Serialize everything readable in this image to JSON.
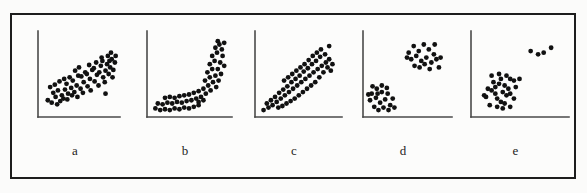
{
  "figure": {
    "caption_labels": [
      "a",
      "b",
      "c",
      "d",
      "e"
    ],
    "background_color": "#fcfcfb",
    "frame_color": "#1d1d1d",
    "dot_color": "#111111",
    "axis_color": "#4a4a4a",
    "dot_radius": 2.4,
    "panel_count": 5
  },
  "chart_data": [
    {
      "type": "scatter",
      "title": "a",
      "label": "a",
      "pattern": "positive linear association",
      "xlabel": "",
      "ylabel": "",
      "xlim": [
        0,
        100
      ],
      "ylim": [
        0,
        100
      ],
      "grid": false,
      "legend": "none",
      "axis_origin": {
        "x": 36,
        "y": 128
      },
      "axis_x_end": 118,
      "axis_y_top": 42,
      "n_points": 62,
      "points": [
        [
          10,
          18
        ],
        [
          15,
          15
        ],
        [
          20,
          22
        ],
        [
          26,
          17
        ],
        [
          17,
          27
        ],
        [
          23,
          30
        ],
        [
          13,
          34
        ],
        [
          19,
          37
        ],
        [
          28,
          24
        ],
        [
          32,
          31
        ],
        [
          25,
          41
        ],
        [
          31,
          44
        ],
        [
          36,
          26
        ],
        [
          40,
          33
        ],
        [
          34,
          38
        ],
        [
          38,
          46
        ],
        [
          44,
          28
        ],
        [
          47,
          36
        ],
        [
          42,
          42
        ],
        [
          49,
          48
        ],
        [
          45,
          54
        ],
        [
          52,
          32
        ],
        [
          56,
          40
        ],
        [
          53,
          47
        ],
        [
          58,
          52
        ],
        [
          50,
          58
        ],
        [
          61,
          35
        ],
        [
          64,
          44
        ],
        [
          60,
          50
        ],
        [
          67,
          55
        ],
        [
          63,
          61
        ],
        [
          70,
          41
        ],
        [
          73,
          49
        ],
        [
          69,
          57
        ],
        [
          76,
          52
        ],
        [
          72,
          64
        ],
        [
          78,
          60
        ],
        [
          81,
          46
        ],
        [
          84,
          54
        ],
        [
          80,
          66
        ],
        [
          86,
          62
        ],
        [
          88,
          50
        ],
        [
          90,
          58
        ],
        [
          92,
          68
        ],
        [
          87,
          72
        ],
        [
          94,
          55
        ],
        [
          96,
          64
        ],
        [
          91,
          76
        ],
        [
          30,
          20
        ],
        [
          35,
          19
        ],
        [
          48,
          22
        ],
        [
          55,
          27
        ],
        [
          41,
          24
        ],
        [
          22,
          13
        ],
        [
          65,
          30
        ],
        [
          75,
          36
        ],
        [
          83,
          40
        ],
        [
          93,
          46
        ],
        [
          97,
          72
        ],
        [
          89,
          66
        ],
        [
          79,
          70
        ],
        [
          84,
          26
        ]
      ],
      "outlier_points": [
        [
          84,
          26
        ]
      ]
    },
    {
      "type": "scatter",
      "title": "b",
      "label": "b",
      "pattern": "nonlinear J-shaped (curvilinear) association",
      "xlabel": "",
      "ylabel": "",
      "xlim": [
        0,
        100
      ],
      "ylim": [
        0,
        100
      ],
      "grid": false,
      "legend": "none",
      "axis_origin": {
        "x": 145,
        "y": 128
      },
      "axis_x_end": 232,
      "axis_y_top": 42,
      "n_points": 56,
      "points": [
        [
          8,
          8
        ],
        [
          14,
          6
        ],
        [
          20,
          7
        ],
        [
          26,
          6
        ],
        [
          32,
          8
        ],
        [
          38,
          7
        ],
        [
          44,
          9
        ],
        [
          50,
          8
        ],
        [
          56,
          10
        ],
        [
          62,
          12
        ],
        [
          11,
          14
        ],
        [
          17,
          13
        ],
        [
          23,
          15
        ],
        [
          29,
          14
        ],
        [
          35,
          16
        ],
        [
          41,
          15
        ],
        [
          47,
          17
        ],
        [
          53,
          18
        ],
        [
          59,
          20
        ],
        [
          65,
          22
        ],
        [
          20,
          21
        ],
        [
          26,
          22
        ],
        [
          32,
          21
        ],
        [
          38,
          23
        ],
        [
          44,
          24
        ],
        [
          50,
          25
        ],
        [
          56,
          27
        ],
        [
          62,
          29
        ],
        [
          68,
          32
        ],
        [
          71,
          26
        ],
        [
          74,
          36
        ],
        [
          77,
          30
        ],
        [
          70,
          42
        ],
        [
          76,
          46
        ],
        [
          80,
          40
        ],
        [
          73,
          52
        ],
        [
          79,
          56
        ],
        [
          83,
          48
        ],
        [
          76,
          62
        ],
        [
          82,
          66
        ],
        [
          86,
          56
        ],
        [
          79,
          72
        ],
        [
          85,
          76
        ],
        [
          89,
          64
        ],
        [
          83,
          82
        ],
        [
          88,
          86
        ],
        [
          92,
          72
        ],
        [
          86,
          90
        ],
        [
          91,
          80
        ],
        [
          94,
          60
        ],
        [
          90,
          50
        ],
        [
          87,
          42
        ],
        [
          84,
          34
        ],
        [
          94,
          88
        ],
        [
          68,
          18
        ],
        [
          62,
          16
        ]
      ]
    },
    {
      "type": "scatter",
      "title": "c",
      "label": "c",
      "pattern": "fan / wedge shaped spread increasing with x",
      "xlabel": "",
      "ylabel": "",
      "xlim": [
        0,
        100
      ],
      "ylim": [
        0,
        100
      ],
      "grid": false,
      "legend": "none",
      "axis_origin": {
        "x": 252,
        "y": 128
      },
      "axis_x_end": 340,
      "axis_y_top": 42,
      "n_points": 58,
      "points": [
        [
          8,
          6
        ],
        [
          14,
          9
        ],
        [
          12,
          14
        ],
        [
          19,
          12
        ],
        [
          17,
          18
        ],
        [
          24,
          16
        ],
        [
          22,
          22
        ],
        [
          29,
          20
        ],
        [
          27,
          27
        ],
        [
          34,
          24
        ],
        [
          32,
          31
        ],
        [
          39,
          28
        ],
        [
          37,
          35
        ],
        [
          44,
          32
        ],
        [
          42,
          40
        ],
        [
          49,
          36
        ],
        [
          47,
          44
        ],
        [
          54,
          40
        ],
        [
          52,
          48
        ],
        [
          59,
          44
        ],
        [
          57,
          53
        ],
        [
          64,
          48
        ],
        [
          62,
          57
        ],
        [
          69,
          52
        ],
        [
          67,
          62
        ],
        [
          74,
          56
        ],
        [
          72,
          66
        ],
        [
          79,
          60
        ],
        [
          77,
          71
        ],
        [
          84,
          64
        ],
        [
          58,
          62
        ],
        [
          53,
          58
        ],
        [
          48,
          54
        ],
        [
          43,
          50
        ],
        [
          38,
          46
        ],
        [
          33,
          42
        ],
        [
          63,
          67
        ],
        [
          68,
          72
        ],
        [
          73,
          76
        ],
        [
          78,
          80
        ],
        [
          83,
          74
        ],
        [
          88,
          68
        ],
        [
          86,
          58
        ],
        [
          81,
          52
        ],
        [
          76,
          46
        ],
        [
          71,
          40
        ],
        [
          66,
          36
        ],
        [
          61,
          32
        ],
        [
          56,
          28
        ],
        [
          51,
          24
        ],
        [
          46,
          20
        ],
        [
          41,
          17
        ],
        [
          36,
          14
        ],
        [
          31,
          11
        ],
        [
          26,
          9
        ],
        [
          88,
          84
        ],
        [
          92,
          62
        ],
        [
          90,
          54
        ]
      ]
    },
    {
      "type": "scatter",
      "title": "d",
      "label": "d",
      "pattern": "two separated clusters (lower-left and upper-right)",
      "xlabel": "",
      "ylabel": "",
      "xlim": [
        0,
        100
      ],
      "ylim": [
        0,
        100
      ],
      "grid": false,
      "legend": "none",
      "axis_origin": {
        "x": 360,
        "y": 128
      },
      "axis_x_end": 450,
      "axis_y_top": 42,
      "n_points": 40,
      "clusters": [
        {
          "name": "lower-left cluster",
          "points": [
            [
              8,
              26
            ],
            [
              14,
              32
            ],
            [
              6,
              18
            ],
            [
              13,
              21
            ],
            [
              20,
              28
            ],
            [
              18,
              15
            ],
            [
              11,
              10
            ],
            [
              24,
              19
            ],
            [
              27,
              26
            ],
            [
              22,
              9
            ],
            [
              30,
              12
            ],
            [
              16,
              6
            ],
            [
              9,
              35
            ],
            [
              20,
              36
            ],
            [
              26,
              33
            ],
            [
              33,
              20
            ],
            [
              35,
              9
            ],
            [
              28,
              6
            ],
            [
              4,
              25
            ],
            [
              15,
              26
            ]
          ]
        },
        {
          "name": "upper-right cluster",
          "points": [
            [
              52,
              76
            ],
            [
              58,
              84
            ],
            [
              64,
              78
            ],
            [
              70,
              86
            ],
            [
              76,
              80
            ],
            [
              82,
              74
            ],
            [
              55,
              68
            ],
            [
              61,
              72
            ],
            [
              67,
              66
            ],
            [
              73,
              70
            ],
            [
              79,
              64
            ],
            [
              85,
              68
            ],
            [
              59,
              60
            ],
            [
              65,
              58
            ],
            [
              71,
              62
            ],
            [
              77,
              56
            ],
            [
              88,
              58
            ],
            [
              83,
              86
            ],
            [
              90,
              70
            ],
            [
              50,
              70
            ]
          ]
        }
      ]
    },
    {
      "type": "scatter",
      "title": "e",
      "label": "e",
      "pattern": "main cluster plus small group of outliers",
      "xlabel": "",
      "ylabel": "",
      "xlim": [
        0,
        100
      ],
      "ylim": [
        0,
        100
      ],
      "grid": false,
      "legend": "none",
      "axis_origin": {
        "x": 467,
        "y": 128
      },
      "axis_x_end": 566,
      "axis_y_top": 42,
      "n_points": 33,
      "clusters": [
        {
          "name": "main cluster",
          "points": [
            [
              14,
              22
            ],
            [
              20,
              30
            ],
            [
              26,
              20
            ],
            [
              32,
              28
            ],
            [
              22,
              40
            ],
            [
              28,
              38
            ],
            [
              34,
              36
            ],
            [
              40,
              26
            ],
            [
              18,
              12
            ],
            [
              26,
              10
            ],
            [
              34,
              14
            ],
            [
              40,
              44
            ],
            [
              46,
              34
            ],
            [
              16,
              32
            ],
            [
              24,
              26
            ],
            [
              30,
              44
            ],
            [
              36,
              24
            ],
            [
              44,
              20
            ],
            [
              12,
              24
            ],
            [
              20,
              48
            ],
            [
              28,
              50
            ],
            [
              36,
              48
            ],
            [
              44,
              42
            ],
            [
              50,
              44
            ],
            [
              32,
              8
            ],
            [
              40,
              10
            ],
            [
              24,
              34
            ],
            [
              30,
              16
            ],
            [
              38,
              32
            ]
          ]
        },
        {
          "name": "outlier group",
          "points": [
            [
              62,
              78
            ],
            [
              70,
              74
            ],
            [
              76,
              76
            ],
            [
              84,
              82
            ]
          ]
        }
      ]
    }
  ]
}
